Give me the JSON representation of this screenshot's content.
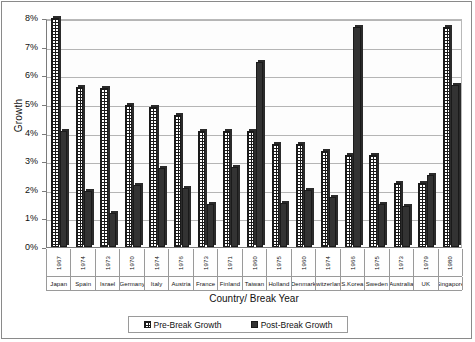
{
  "chart_data": {
    "type": "bar",
    "title": "",
    "xlabel": "Country/ Break Year",
    "ylabel": "Growth",
    "ylim": [
      0,
      8
    ],
    "ytick_labels": [
      "0%",
      "1%",
      "2%",
      "3%",
      "4%",
      "5%",
      "6%",
      "7%",
      "8%"
    ],
    "ytick_values": [
      0,
      1,
      2,
      3,
      4,
      5,
      6,
      7,
      8
    ],
    "grid": true,
    "legend_position": "bottom",
    "categories": [
      "Japan",
      "Spain",
      "Israel",
      "Germany",
      "Italy",
      "Austria",
      "France",
      "Finland",
      "Taiwan",
      "Holland",
      "Denmark",
      "Switzerland",
      "S.Korea",
      "Sweden",
      "Australia",
      "UK",
      "Singapore"
    ],
    "break_years": [
      "1967",
      "1974",
      "1973",
      "1970",
      "1974",
      "1976",
      "1973",
      "1971",
      "1960",
      "1975",
      "1960",
      "1974",
      "1966",
      "1975",
      "1973",
      "1979",
      "1980"
    ],
    "series": [
      {
        "name": "Pre-Break Growth",
        "color": "#ffffff",
        "values": [
          8.0,
          5.6,
          5.55,
          4.95,
          4.9,
          4.6,
          4.05,
          4.05,
          4.05,
          3.6,
          3.6,
          3.35,
          3.2,
          3.2,
          2.25,
          2.25,
          7.7
        ]
      },
      {
        "name": "Post-Break Growth",
        "color": "#333333",
        "values": [
          4.05,
          1.95,
          1.2,
          2.15,
          2.75,
          2.05,
          1.5,
          2.8,
          6.45,
          1.55,
          2.0,
          1.75,
          7.7,
          1.5,
          1.45,
          2.5,
          5.65
        ]
      }
    ]
  },
  "legend": {
    "items": [
      {
        "label": "Pre-Break Growth",
        "swatch": "pre"
      },
      {
        "label": "Post-Break Growth",
        "swatch": "post"
      }
    ]
  }
}
